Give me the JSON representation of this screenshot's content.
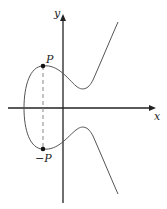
{
  "diagram": {
    "type": "elliptic-curve",
    "axes": {
      "x_label": "x",
      "y_label": "y"
    },
    "points": [
      {
        "label": "P",
        "role": "point"
      },
      {
        "label": "−P",
        "role": "negated-point"
      }
    ],
    "colors": {
      "curve": "#555555",
      "axes": "#222222",
      "dashed": "#888888",
      "points": "#111111"
    }
  }
}
